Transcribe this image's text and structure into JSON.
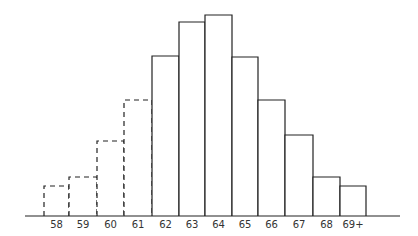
{
  "chart_data": {
    "type": "bar",
    "title": "",
    "xlabel": "",
    "ylabel": "",
    "categories": [
      "58",
      "59",
      "60",
      "61",
      "62",
      "63",
      "64",
      "65",
      "66",
      "67",
      "68",
      "69+"
    ],
    "values": [
      30,
      39,
      75,
      116,
      160,
      194,
      201,
      159,
      116,
      81,
      39,
      30
    ],
    "bar_style": [
      "dashed",
      "dashed",
      "dashed",
      "dashed",
      "solid",
      "solid",
      "solid",
      "solid",
      "solid",
      "solid",
      "solid",
      "solid"
    ],
    "ylim": [
      0,
      210
    ],
    "grid": false,
    "legend": null
  },
  "colors": {
    "stroke": "#222222",
    "fill": "#ffffff",
    "label": "#333333"
  }
}
